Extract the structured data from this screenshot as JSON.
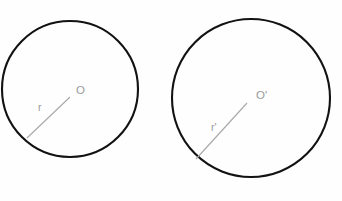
{
  "figure": {
    "background_color": "#fefefe",
    "stroke_color": "#121212",
    "label_color": "#9a9a9a",
    "radius_line_color": "#a9a9a9",
    "width": 342,
    "height": 201
  },
  "shapes": [
    {
      "id": "circle-left",
      "name": "small-circle",
      "center_x": 70,
      "center_y": 89,
      "radius": 68,
      "center_label": "O",
      "center_label_x": 76,
      "center_label_y": 91,
      "radius_label": "r",
      "radius_label_x": 38,
      "radius_label_y": 108,
      "radius_line": {
        "x1": 70,
        "y1": 97,
        "x2": 27,
        "y2": 138
      }
    },
    {
      "id": "circle-right",
      "name": "large-circle",
      "center_x": 251,
      "center_y": 98,
      "radius": 79,
      "center_label": "O'",
      "center_label_x": 256,
      "center_label_y": 96,
      "radius_label": "r'",
      "radius_label_x": 211,
      "radius_label_y": 128,
      "radius_line": {
        "x1": 247,
        "y1": 103,
        "x2": 196,
        "y2": 159
      }
    }
  ]
}
